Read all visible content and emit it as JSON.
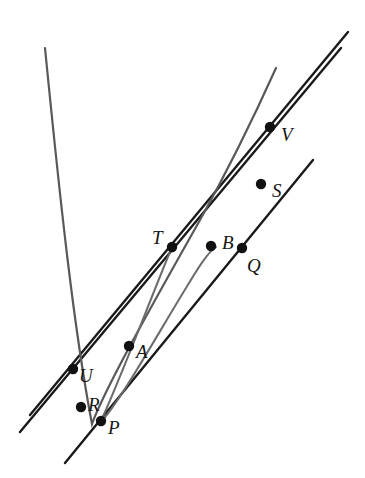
{
  "figure": {
    "kind": "geometry-diagram",
    "width": 365,
    "height": 478,
    "background_color": "#ffffff",
    "stroke_colors": {
      "line": "#1a1a1a",
      "parabola_large": "#595959",
      "parabola_small": "#6b6b6b",
      "point_fill": "#111111",
      "label": "#151515"
    },
    "stroke_widths": {
      "line": 2.4,
      "parabola_large": 2.2,
      "parabola_small": 2.0
    },
    "point_radius": 5.2
  },
  "points": [
    {
      "id": "V",
      "label": "V",
      "x": 270,
      "y": 127,
      "label_x": 281,
      "label_y": 125
    },
    {
      "id": "S",
      "label": "S",
      "x": 261,
      "y": 184,
      "label_x": 272,
      "label_y": 181
    },
    {
      "id": "T",
      "label": "T",
      "x": 172,
      "y": 247,
      "label_x": 152,
      "label_y": 228
    },
    {
      "id": "B",
      "label": "B",
      "x": 211,
      "y": 246,
      "label_x": 222,
      "label_y": 233
    },
    {
      "id": "Q",
      "label": "Q",
      "x": 242,
      "y": 248,
      "label_x": 247,
      "label_y": 256
    },
    {
      "id": "A",
      "label": "A",
      "x": 129,
      "y": 346,
      "label_x": 136,
      "label_y": 342
    },
    {
      "id": "U",
      "label": "U",
      "x": 73,
      "y": 369,
      "label_x": 79,
      "label_y": 366
    },
    {
      "id": "R",
      "label": "R",
      "x": 81,
      "y": 407,
      "label_x": 88,
      "label_y": 395
    },
    {
      "id": "P",
      "label": "P",
      "x": 101,
      "y": 421,
      "label_x": 108,
      "label_y": 418
    }
  ],
  "lines": [
    {
      "id": "line-upper",
      "name": "line-through-U-T-V",
      "x1": 30,
      "y1": 415,
      "x2": 348,
      "y2": 32
    },
    {
      "id": "line-middle",
      "name": "line-through-R-B-S",
      "x1": 20,
      "y1": 432,
      "x2": 341,
      "y2": 48
    },
    {
      "id": "line-lower",
      "name": "line-through-P-Q",
      "x1": 65,
      "y1": 463,
      "x2": 313,
      "y2": 160
    }
  ],
  "curves": [
    {
      "id": "parabola-large",
      "name": "large-parabola-through-U-R-Q-S-V",
      "path": "M 45,48 C 60,200 74,330 92,424 C 105,388 155,300 200,220 C 228,170 258,108 276,68"
    },
    {
      "id": "parabola-small",
      "name": "small-parabola-through-T-A-P-B",
      "path": "M 172,247 C 150,300 118,385 100,423 C 120,402 160,330 186,288 C 198,268 208,252 216,247"
    }
  ]
}
